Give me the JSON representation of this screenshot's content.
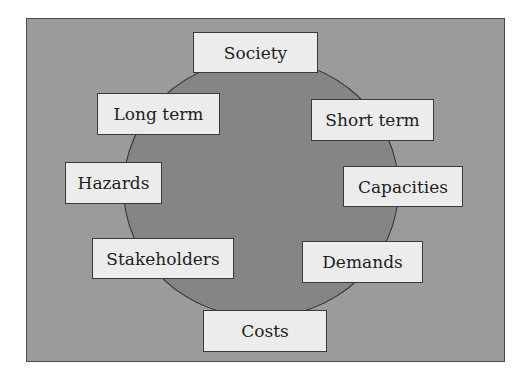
{
  "diagram": {
    "type": "circular-factor-diagram",
    "colors": {
      "frame_bg": "#9b9b9b",
      "circle_bg": "#858585",
      "box_bg": "#ececec",
      "border": "#3a3a3a"
    },
    "labels": [
      {
        "id": "society",
        "text": "Society"
      },
      {
        "id": "long-term",
        "text": "Long term"
      },
      {
        "id": "short-term",
        "text": "Short term"
      },
      {
        "id": "hazards",
        "text": "Hazards"
      },
      {
        "id": "capacities",
        "text": "Capacities"
      },
      {
        "id": "stakeholders",
        "text": "Stakeholders"
      },
      {
        "id": "demands",
        "text": "Demands"
      },
      {
        "id": "costs",
        "text": "Costs"
      }
    ]
  }
}
